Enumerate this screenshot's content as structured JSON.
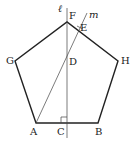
{
  "diagram": {
    "type": "regular-pentagon-construction",
    "colors": {
      "stroke": "#222222",
      "thin_stroke": "#444444",
      "background": "#ffffff"
    },
    "vertices": {
      "A": "A",
      "B": "B",
      "H": "H",
      "F": "F",
      "G": "G"
    },
    "points": {
      "C": "C",
      "D": "D",
      "E": "E"
    },
    "lines": {
      "l": "ℓ",
      "m": "m"
    },
    "annotations": {
      "right_angle_at": "C"
    }
  }
}
